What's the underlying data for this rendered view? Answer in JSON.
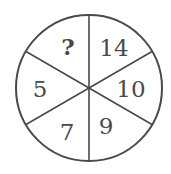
{
  "puzzle": {
    "type": "number-wheel",
    "segments": [
      {
        "position": "top-left",
        "value": "?"
      },
      {
        "position": "top-right",
        "value": "14"
      },
      {
        "position": "right",
        "value": "10"
      },
      {
        "position": "bottom-right",
        "value": "9"
      },
      {
        "position": "bottom-left",
        "value": "7"
      },
      {
        "position": "left",
        "value": "5"
      }
    ]
  },
  "colors": {
    "stroke": "#4a4a4a",
    "background": "#ffffff"
  }
}
